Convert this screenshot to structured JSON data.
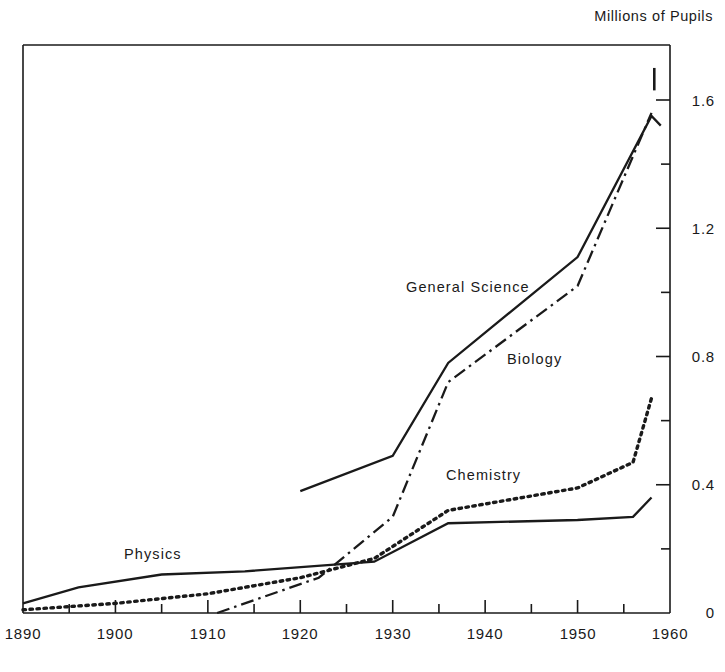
{
  "chart_data": {
    "type": "line",
    "title": "Millions of Pupils",
    "xlabel": "",
    "ylabel": "Millions of Pupils",
    "xlim": [
      1890,
      1960
    ],
    "ylim": [
      0,
      1.7
    ],
    "grid": false,
    "legend_position": "inline-annotations",
    "x_ticks_major": [
      1890,
      1900,
      1910,
      1920,
      1930,
      1940,
      1950,
      1960
    ],
    "x_ticks_minor": [
      1895,
      1905,
      1915,
      1925,
      1935,
      1945,
      1955
    ],
    "y_ticks_major": [
      0,
      0.4,
      0.8,
      1.2,
      1.6
    ],
    "y_ticks_minor": [
      0.2,
      0.6,
      1.0,
      1.4
    ],
    "y_tick_labels": [
      "0",
      "0.4",
      "0.8",
      "1.2",
      "1.6"
    ],
    "x_tick_labels": [
      "1890",
      "1900",
      "1910",
      "1920",
      "1930",
      "1940",
      "1950",
      "1960"
    ],
    "y_axis_side": "right",
    "series": [
      {
        "name": "General Science",
        "style": "solid",
        "label_x": 1930,
        "label_y": 0.93,
        "x": [
          1920,
          1930,
          1936,
          1950,
          1958,
          1959
        ],
        "values": [
          0.38,
          0.49,
          0.78,
          1.11,
          1.55,
          1.52
        ]
      },
      {
        "name": "Biology",
        "style": "dash-dot",
        "label_x": 1945,
        "label_y": 0.73,
        "x": [
          1911,
          1915,
          1922,
          1930,
          1936,
          1950,
          1958
        ],
        "values": [
          0.0,
          0.04,
          0.11,
          0.3,
          0.72,
          1.02,
          1.56
        ]
      },
      {
        "name": "Chemistry",
        "style": "dotted",
        "label_x": 1943,
        "label_y": 0.45,
        "x": [
          1890,
          1900,
          1910,
          1920,
          1928,
          1936,
          1950,
          1956,
          1958
        ],
        "values": [
          0.01,
          0.03,
          0.06,
          0.11,
          0.17,
          0.32,
          0.39,
          0.47,
          0.67
        ]
      },
      {
        "name": "Physics",
        "style": "solid",
        "label_x": 1904,
        "label_y": 0.2,
        "x": [
          1890,
          1896,
          1905,
          1914,
          1928,
          1936,
          1950,
          1956,
          1958
        ],
        "values": [
          0.03,
          0.08,
          0.12,
          0.13,
          0.16,
          0.28,
          0.29,
          0.3,
          0.36
        ]
      }
    ],
    "annotations": [
      {
        "name": "biology-endpoint-tick",
        "x": 1958.3,
        "y_from": 1.63,
        "y_to": 1.7
      }
    ]
  },
  "labels": {
    "title": "Millions of Pupils",
    "general_science": "General Science",
    "biology": "Biology",
    "chemistry": "Chemistry",
    "physics": "Physics",
    "y0": "0",
    "y04": "0.4",
    "y08": "0.8",
    "y12": "1.2",
    "y16": "1.6",
    "x1890": "1890",
    "x1900": "1900",
    "x1910": "1910",
    "x1920": "1920",
    "x1930": "1930",
    "x1940": "1940",
    "x1950": "1950",
    "x1960": "1960"
  },
  "colors": {
    "ink": "#1a1a1a",
    "background": "#ffffff"
  }
}
